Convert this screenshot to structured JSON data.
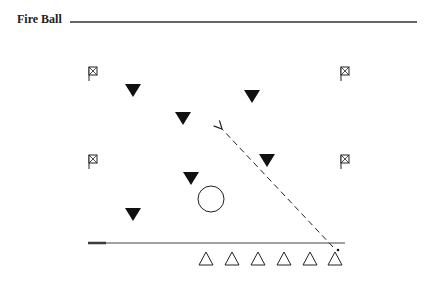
{
  "title": "Fire Ball",
  "diagram": {
    "flags": [
      {
        "id": "flag-top-left"
      },
      {
        "id": "flag-top-right"
      },
      {
        "id": "flag-mid-left"
      },
      {
        "id": "flag-mid-right"
      }
    ],
    "defenders_filled": 6,
    "attackers_hollow": 6,
    "ball": "circle",
    "arrow": {
      "style": "dashed",
      "direction": "up-left"
    }
  }
}
